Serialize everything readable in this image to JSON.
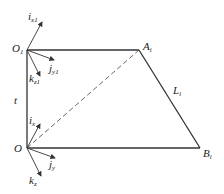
{
  "diagram": {
    "points": {
      "O1": {
        "label": "O",
        "sub": "1",
        "x": 27,
        "y": 50
      },
      "A": {
        "label": "A",
        "sub": "i",
        "x": 139,
        "y": 50
      },
      "B": {
        "label": "B",
        "sub": "i",
        "x": 200,
        "y": 148
      },
      "O": {
        "label": "O",
        "sub": "",
        "x": 27,
        "y": 148
      }
    },
    "edges": {
      "link_label": {
        "label": "L",
        "sub": "i"
      },
      "height_label": {
        "label": "t"
      }
    },
    "top_frame": {
      "i": {
        "label": "i",
        "sub": "x1"
      },
      "j": {
        "label": "j",
        "sub": "y1"
      },
      "k": {
        "label": "k",
        "sub": "z1"
      }
    },
    "bottom_frame": {
      "i": {
        "label": "i",
        "sub": "x"
      },
      "j": {
        "label": "j",
        "sub": "y"
      },
      "k": {
        "label": "k",
        "sub": "z"
      }
    },
    "colors": {
      "line": "#333333",
      "dashed": "#555555"
    }
  }
}
